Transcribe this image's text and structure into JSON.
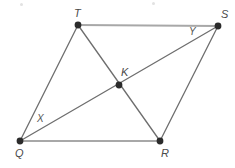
{
  "figure": {
    "width": 235,
    "height": 168,
    "background_color": "#ffffff"
  },
  "colors": {
    "side_line": "#a8a8a8",
    "diagonal_line": "#6e6e6e",
    "vertex_dot": "#2b2b2b",
    "label_text": "#4a4a4a",
    "point_label_text": "#555555"
  },
  "vertices": [
    {
      "id": "T",
      "label": "T",
      "x": 78,
      "y": 25,
      "label_x": 74,
      "label_y": 8,
      "dot_radius": 3.4
    },
    {
      "id": "S",
      "label": "S",
      "x": 218,
      "y": 26,
      "label_x": 221,
      "label_y": 9,
      "dot_radius": 3.4
    },
    {
      "id": "K",
      "label": "K",
      "x": 119,
      "y": 85,
      "label_x": 121,
      "label_y": 67,
      "dot_radius": 3.4
    },
    {
      "id": "Q",
      "label": "Q",
      "x": 20,
      "y": 141,
      "label_x": 15,
      "label_y": 148,
      "dot_radius": 3.4
    },
    {
      "id": "R",
      "label": "R",
      "x": 160,
      "y": 141,
      "label_x": 161,
      "label_y": 148,
      "dot_radius": 3.4
    }
  ],
  "point_labels": [
    {
      "id": "X",
      "label": "X",
      "x": 37,
      "y": 114
    },
    {
      "id": "Y",
      "label": "Y",
      "x": 189,
      "y": 27
    }
  ],
  "segments": [
    {
      "id": "TS",
      "from": "T",
      "to": "S",
      "kind": "side",
      "x1": 78,
      "y1": 25,
      "x2": 218,
      "y2": 26,
      "stroke": "#a8a8a8",
      "width": 2.2
    },
    {
      "id": "QR",
      "from": "Q",
      "to": "R",
      "kind": "side",
      "x1": 20,
      "y1": 141,
      "x2": 160,
      "y2": 141,
      "stroke": "#a8a8a8",
      "width": 2.2
    },
    {
      "id": "QT",
      "from": "Q",
      "to": "T",
      "kind": "side",
      "x1": 20,
      "y1": 141,
      "x2": 78,
      "y2": 25,
      "stroke": "#6e6e6e",
      "width": 1.3
    },
    {
      "id": "RS",
      "from": "R",
      "to": "S",
      "kind": "side",
      "x1": 160,
      "y1": 141,
      "x2": 218,
      "y2": 26,
      "stroke": "#6e6e6e",
      "width": 1.3
    },
    {
      "id": "QS",
      "from": "Q",
      "to": "S",
      "kind": "diagonal",
      "x1": 20,
      "y1": 141,
      "x2": 218,
      "y2": 26,
      "stroke": "#6e6e6e",
      "width": 1.3
    },
    {
      "id": "TR",
      "from": "T",
      "to": "R",
      "kind": "diagonal",
      "x1": 78,
      "y1": 25,
      "x2": 160,
      "y2": 141,
      "stroke": "#6e6e6e",
      "width": 1.3
    }
  ],
  "artifacts": [
    {
      "id": "speck-top-left",
      "x": 20,
      "y": 3
    },
    {
      "id": "speck-top-right",
      "x": 152,
      "y": 2
    }
  ]
}
